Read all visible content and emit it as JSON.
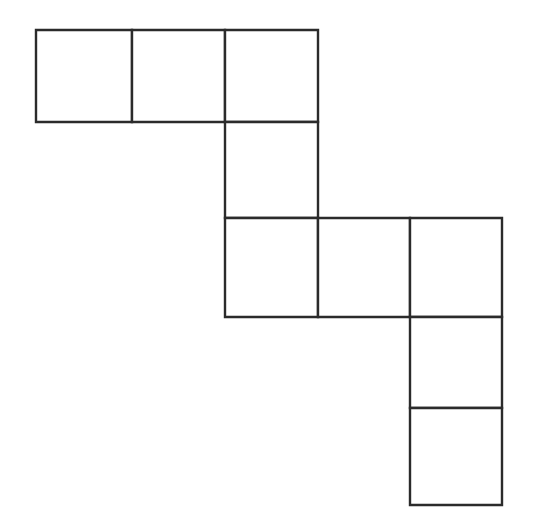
{
  "figure": {
    "title": "Polyomino staircase grid figure",
    "shape_type": "polyomino",
    "cell_count": 8,
    "line_color": "#2b2b2b",
    "fill_color": "#ffffff",
    "background_color": "#ffffff",
    "stroke_width_px": 2,
    "canvas": {
      "width": 538,
      "height": 529
    },
    "grid": {
      "cell_width_px": 93,
      "cell_height_px": 94,
      "column_x": [
        36,
        132,
        225,
        318,
        410,
        502
      ],
      "row_y": [
        30,
        122,
        218,
        317,
        408,
        505
      ],
      "columns": 5,
      "rows": 5
    },
    "cells": [
      {
        "id": "cell-r0c0",
        "row": 0,
        "col": 0,
        "x": 36,
        "y": 30,
        "w": 96,
        "h": 92,
        "label": ""
      },
      {
        "id": "cell-r0c1",
        "row": 0,
        "col": 1,
        "x": 132,
        "y": 30,
        "w": 93,
        "h": 92,
        "label": ""
      },
      {
        "id": "cell-r0c2",
        "row": 0,
        "col": 2,
        "x": 225,
        "y": 30,
        "w": 93,
        "h": 92,
        "label": ""
      },
      {
        "id": "cell-r1c2",
        "row": 1,
        "col": 2,
        "x": 225,
        "y": 122,
        "w": 93,
        "h": 96,
        "label": ""
      },
      {
        "id": "cell-r2c2",
        "row": 2,
        "col": 2,
        "x": 225,
        "y": 218,
        "w": 93,
        "h": 99,
        "label": ""
      },
      {
        "id": "cell-r2c3",
        "row": 2,
        "col": 3,
        "x": 318,
        "y": 218,
        "w": 92,
        "h": 99,
        "label": ""
      },
      {
        "id": "cell-r2c4",
        "row": 2,
        "col": 4,
        "x": 410,
        "y": 218,
        "w": 92,
        "h": 99,
        "label": ""
      },
      {
        "id": "cell-r3c4",
        "row": 3,
        "col": 4,
        "x": 410,
        "y": 317,
        "w": 92,
        "h": 91,
        "label": ""
      },
      {
        "id": "cell-r4c4",
        "row": 4,
        "col": 4,
        "x": 410,
        "y": 408,
        "w": 92,
        "h": 97,
        "label": ""
      }
    ]
  }
}
